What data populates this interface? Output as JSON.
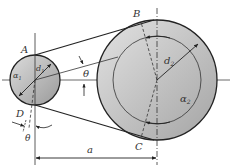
{
  "diagram": {
    "type": "belt-drive-geometry",
    "labels": {
      "point_a": "A",
      "point_b": "B",
      "point_c": "C",
      "point_d": "D",
      "theta_top": "θ",
      "theta_bottom": "θ",
      "small_diameter": "d",
      "small_diameter_sub": "1",
      "large_diameter": "d",
      "large_diameter_sub": "2",
      "small_angle": "α",
      "small_angle_sub": "1",
      "large_angle": "α",
      "large_angle_sub": "2",
      "center_distance": "a"
    },
    "colors": {
      "pulley_fill_light": "#e6e6e6",
      "pulley_fill_dark": "#a8a8a8",
      "line": "#222222",
      "label": "#333333"
    }
  }
}
